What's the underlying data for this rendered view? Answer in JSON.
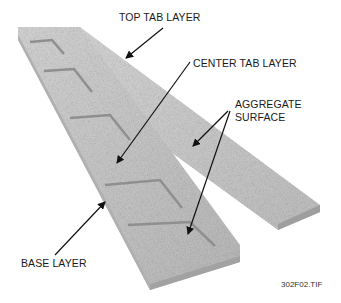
{
  "labels": {
    "top_tab_layer": "TOP TAB LAYER",
    "center_tab_layer": "CENTER TAB LAYER",
    "aggregate_line1": "AGGREGATE",
    "aggregate_line2": "SURFACE",
    "base_layer": "BASE LAYER"
  },
  "caption": "302F02.TIF",
  "colors": {
    "shingle_light": "#d4d4d4",
    "shingle_mid": "#bdbdbd",
    "shingle_dark": "#9a9a9a",
    "edge": "#8a8a8a",
    "arrow": "#111111"
  }
}
